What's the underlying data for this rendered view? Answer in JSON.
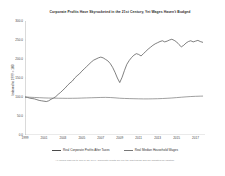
{
  "chart_data": {
    "type": "line",
    "title": "Corporate Profits Have Skyrocketed in the 21st Century, Yet Wages Haven't Budged",
    "xlabel": "",
    "ylabel": "Indexed to 1999 = 100",
    "xlim": [
      1999,
      2018
    ],
    "ylim": [
      0,
      300
    ],
    "grid": false,
    "legend_position": "bottom",
    "note": "All values indexed to 100 in Q1 1999. Corporate profits are pre-tax and trailing and are adjusted for inflation.",
    "yticks": [
      "0.0",
      "50.0",
      "100.0",
      "150.0",
      "200.0",
      "250.0",
      "300.0"
    ],
    "ytick_values": [
      0,
      50,
      100,
      150,
      200,
      250,
      300
    ],
    "xticks": [
      "1999",
      "2001",
      "2003",
      "2005",
      "2007",
      "2009",
      "2011",
      "2013",
      "2015",
      "2017"
    ],
    "xtick_values": [
      1999,
      2001,
      2003,
      2005,
      2007,
      2009,
      2011,
      2013,
      2015,
      2017
    ],
    "series": [
      {
        "name": "Real Corporate Profits After Taxes",
        "color": "#4a4a4a",
        "x": [
          1999.0,
          1999.25,
          1999.5,
          1999.75,
          2000.0,
          2000.25,
          2000.5,
          2000.75,
          2001.0,
          2001.25,
          2001.5,
          2001.75,
          2002.0,
          2002.25,
          2002.5,
          2002.75,
          2003.0,
          2003.25,
          2003.5,
          2003.75,
          2004.0,
          2004.25,
          2004.5,
          2004.75,
          2005.0,
          2005.25,
          2005.5,
          2005.75,
          2006.0,
          2006.25,
          2006.5,
          2006.75,
          2007.0,
          2007.25,
          2007.5,
          2007.75,
          2008.0,
          2008.25,
          2008.5,
          2008.75,
          2009.0,
          2009.25,
          2009.5,
          2009.75,
          2010.0,
          2010.25,
          2010.5,
          2010.75,
          2011.0,
          2011.25,
          2011.5,
          2011.75,
          2012.0,
          2012.25,
          2012.5,
          2012.75,
          2013.0,
          2013.25,
          2013.5,
          2013.75,
          2014.0,
          2014.25,
          2014.5,
          2014.75,
          2015.0,
          2015.25,
          2015.5,
          2015.75,
          2016.0,
          2016.25,
          2016.5,
          2016.75,
          2017.0,
          2017.25,
          2017.5,
          2017.75
        ],
        "values": [
          100,
          99,
          97,
          96,
          95,
          93,
          91,
          90,
          89,
          88,
          90,
          94,
          97,
          101,
          107,
          112,
          118,
          124,
          131,
          137,
          142,
          150,
          156,
          161,
          168,
          174,
          180,
          186,
          192,
          197,
          200,
          203,
          205,
          203,
          199,
          195,
          188,
          178,
          165,
          150,
          138,
          152,
          170,
          186,
          196,
          204,
          210,
          214,
          212,
          208,
          214,
          220,
          226,
          231,
          236,
          240,
          243,
          246,
          248,
          245,
          247,
          250,
          252,
          249,
          245,
          238,
          232,
          236,
          242,
          246,
          248,
          245,
          247,
          249,
          246,
          244
        ]
      },
      {
        "name": "Real Median Household Wages",
        "color": "#777777",
        "x": [
          1999.0,
          1999.5,
          2000.0,
          2000.5,
          2001.0,
          2001.5,
          2002.0,
          2002.5,
          2003.0,
          2003.5,
          2004.0,
          2004.5,
          2005.0,
          2005.5,
          2006.0,
          2006.5,
          2007.0,
          2007.5,
          2008.0,
          2008.5,
          2009.0,
          2009.5,
          2010.0,
          2010.5,
          2011.0,
          2011.5,
          2012.0,
          2012.5,
          2013.0,
          2013.5,
          2014.0,
          2014.5,
          2015.0,
          2015.5,
          2016.0,
          2016.5,
          2017.0,
          2017.5,
          2017.75
        ],
        "values": [
          100,
          99.4,
          98.8,
          98.2,
          97.6,
          97.2,
          97.0,
          96.8,
          96.6,
          96.5,
          96.6,
          96.8,
          97.2,
          97.6,
          98.0,
          98.4,
          98.8,
          99.0,
          98.6,
          97.8,
          96.8,
          96.2,
          95.8,
          95.5,
          95.2,
          95.0,
          95.0,
          95.2,
          95.5,
          96.0,
          96.6,
          97.4,
          98.4,
          99.4,
          100.4,
          101.2,
          101.8,
          102.2,
          102.4
        ]
      }
    ]
  }
}
